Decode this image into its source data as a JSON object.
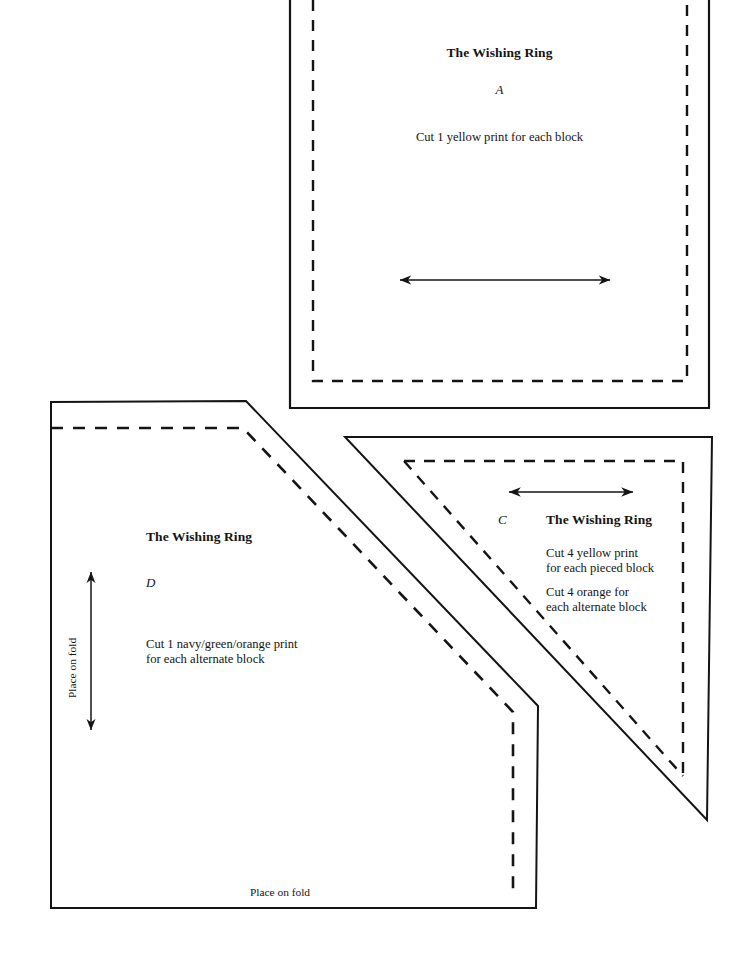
{
  "document": {
    "kind": "quilt-pattern-template-sheet",
    "pattern_name": "The Wishing Ring",
    "ink_color": "#141414",
    "paper_color": "#ffffff"
  },
  "pieces": {
    "a": {
      "title": "The Wishing Ring",
      "letter": "A",
      "cut_note": "Cut 1 yellow print for each block",
      "grain_arrow": "horizontal-double-arrow",
      "cut_line": "solid",
      "seam_line": "dashed"
    },
    "c": {
      "title": "The Wishing Ring",
      "letter": "C",
      "cut_note_1": "Cut 4 yellow print\nfor each pieced block",
      "cut_note_2": "Cut 4 orange for\neach alternate block",
      "grain_arrow": "horizontal-double-arrow",
      "cut_line": "solid",
      "seam_line": "dashed"
    },
    "d": {
      "title": "The Wishing Ring",
      "letter": "D",
      "cut_note": "Cut 1 navy/green/orange print\nfor each alternate block",
      "fold_note_left": "Place on fold",
      "fold_note_bottom": "Place on fold",
      "grain_arrow": "vertical-double-arrow",
      "cut_line": "solid",
      "seam_line": "dashed"
    }
  }
}
